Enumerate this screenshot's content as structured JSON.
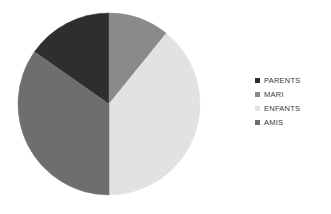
{
  "chart_data": {
    "type": "pie",
    "title": "",
    "subtitle": "",
    "xlabel": "",
    "ylabel": "",
    "grid": false,
    "legend_position": "right",
    "categories": [
      "PARENTS",
      "MARI",
      "ENFANTS",
      "AMIS"
    ],
    "values": [
      15,
      11,
      39,
      35
    ],
    "units": "percent",
    "colors": [
      "#2e2e2e",
      "#8a8a8a",
      "#e2e2e2",
      "#6e6e6e"
    ],
    "slices": [
      {
        "label": "PARENTS",
        "value": 15,
        "color": "#2e2e2e",
        "start_angle": 305,
        "end_angle": 360,
        "position": "upper-left"
      },
      {
        "label": "MARI",
        "value": 11,
        "color": "#8a8a8a",
        "start_angle": 0,
        "end_angle": 39,
        "position": "upper-right"
      },
      {
        "label": "ENFANTS",
        "value": 39,
        "color": "#e2e2e2",
        "start_angle": 39,
        "end_angle": 180,
        "position": "right"
      },
      {
        "label": "AMIS",
        "value": 35,
        "color": "#6e6e6e",
        "start_angle": 180,
        "end_angle": 305,
        "position": "lower-left"
      }
    ],
    "geometry": {
      "center_x": 95,
      "center_y": 96,
      "radius": 91
    }
  },
  "legend": {
    "items": [
      {
        "label": "PARENTS",
        "color": "#2e2e2e"
      },
      {
        "label": "MARI",
        "color": "#8a8a8a"
      },
      {
        "label": "ENFANTS",
        "color": "#e2e2e2"
      },
      {
        "label": "AMIS",
        "color": "#6e6e6e"
      }
    ]
  }
}
